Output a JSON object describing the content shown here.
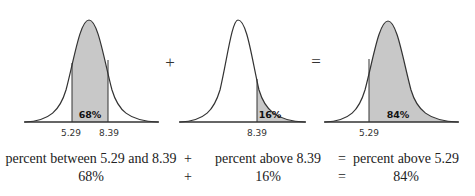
{
  "panels": [
    {
      "id": "between",
      "shaded_percent_label": "68%",
      "x_labels": [
        "5.29",
        "8.39"
      ],
      "shaded_region": "between 5.29 and 8.39"
    },
    {
      "id": "above_upper",
      "shaded_percent_label": "16%",
      "x_labels": [
        "8.39"
      ],
      "shaded_region": "above 8.39"
    },
    {
      "id": "above_lower",
      "shaded_percent_label": "84%",
      "x_labels": [
        "5.29"
      ],
      "shaded_region": "above 5.29"
    }
  ],
  "operators": {
    "plus": "+",
    "equals": "="
  },
  "equation": {
    "row1": {
      "term1": "percent between 5.29 and 8.39",
      "op1": "+",
      "term2": "percent above 8.39",
      "op2": "=",
      "term3": "percent above 5.29"
    },
    "row2": {
      "term1": "68%",
      "op1": "+",
      "term2": "16%",
      "op2": "=",
      "term3": "84%"
    }
  },
  "colors": {
    "shade": "#c8c8c8",
    "curve": "#333333"
  }
}
